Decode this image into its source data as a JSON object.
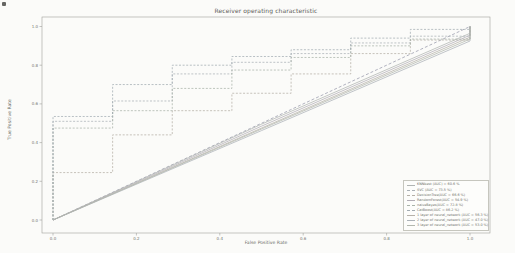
{
  "figure": {
    "title": "Receiver operating characteristic",
    "xlabel": "False Positive Rate",
    "ylabel": "True Positive Rate"
  },
  "chart_data": {
    "type": "line",
    "title": "Receiver operating characteristic",
    "xlabel": "False Positive Rate",
    "ylabel": "True Positive Rate",
    "xlim": [
      0.0,
      1.0
    ],
    "ylim": [
      0.0,
      1.0
    ],
    "x_ticks": [
      "0.0",
      "0.2",
      "0.4",
      "0.6",
      "0.8",
      "1.0"
    ],
    "y_ticks": [
      "0.0",
      "0.2",
      "0.4",
      "0.6",
      "0.8",
      "1.0"
    ],
    "grid": false,
    "legend_position": "lower right",
    "frame_color": "#a0a09a",
    "diagonal": {
      "name": "chance",
      "color": "#9899ab",
      "dash": "3,2",
      "points": [
        [
          0,
          0
        ],
        [
          1,
          1
        ]
      ]
    },
    "series": [
      {
        "name": "KNNbest",
        "label": "KNNbest (AUC) = 60.6 %",
        "auc_pct": 60.6,
        "color": "#b0b4b2",
        "dash": "none",
        "points": [
          [
            0,
            0
          ],
          [
            0.5,
            0.495
          ],
          [
            1,
            0.965
          ],
          [
            1,
            1
          ]
        ]
      },
      {
        "name": "SVC",
        "label": "SVC (AUC = 73.5 %)",
        "auc_pct": 73.5,
        "color": "#aab0b5",
        "dash": "2,1.6",
        "points": [
          [
            0,
            0
          ],
          [
            0,
            0.51
          ],
          [
            0.143,
            0.51
          ],
          [
            0.143,
            0.615
          ],
          [
            0.286,
            0.615
          ],
          [
            0.286,
            0.755
          ],
          [
            0.429,
            0.755
          ],
          [
            0.429,
            0.815
          ],
          [
            0.571,
            0.815
          ],
          [
            0.571,
            0.86
          ],
          [
            0.714,
            0.86
          ],
          [
            0.714,
            0.915
          ],
          [
            0.857,
            0.915
          ],
          [
            0.857,
            0.95
          ],
          [
            1,
            0.95
          ],
          [
            1,
            1
          ]
        ]
      },
      {
        "name": "DecisionTree",
        "label": "DecisionTree(AUC = 66.6 %)",
        "auc_pct": 66.6,
        "color": "#b4afa6",
        "dash": "2,1.6",
        "points": [
          [
            0,
            0
          ],
          [
            0,
            0.245
          ],
          [
            0.143,
            0.245
          ],
          [
            0.143,
            0.44
          ],
          [
            0.286,
            0.44
          ],
          [
            0.286,
            0.565
          ],
          [
            0.429,
            0.565
          ],
          [
            0.429,
            0.655
          ],
          [
            0.571,
            0.655
          ],
          [
            0.571,
            0.755
          ],
          [
            0.714,
            0.755
          ],
          [
            0.714,
            0.86
          ],
          [
            0.857,
            0.86
          ],
          [
            0.857,
            0.93
          ],
          [
            1,
            0.93
          ],
          [
            1,
            1
          ]
        ]
      },
      {
        "name": "RandomForest",
        "label": "RandomForest(AUC = 54.9 %)",
        "auc_pct": 54.9,
        "color": "#b2adb5",
        "dash": "none",
        "points": [
          [
            0,
            0
          ],
          [
            0.5,
            0.485
          ],
          [
            1,
            0.955
          ],
          [
            1,
            1
          ]
        ]
      },
      {
        "name": "naiveBayes",
        "label": "naiveBayes(AUC = 72.8 %)",
        "auc_pct": 72.8,
        "color": "#a8b2a8",
        "dash": "2,1.6",
        "points": [
          [
            0,
            0
          ],
          [
            0,
            0.475
          ],
          [
            0.143,
            0.475
          ],
          [
            0.143,
            0.565
          ],
          [
            0.286,
            0.565
          ],
          [
            0.286,
            0.68
          ],
          [
            0.429,
            0.68
          ],
          [
            0.429,
            0.775
          ],
          [
            0.571,
            0.775
          ],
          [
            0.571,
            0.84
          ],
          [
            0.714,
            0.84
          ],
          [
            0.714,
            0.9
          ],
          [
            0.857,
            0.9
          ],
          [
            0.857,
            0.935
          ],
          [
            1,
            0.935
          ],
          [
            1,
            1
          ]
        ]
      },
      {
        "name": "CatBoost",
        "label": "CatBoost(AUC = 86.2 %)",
        "auc_pct": 86.2,
        "color": "#a2abb1",
        "dash": "2,1.6",
        "points": [
          [
            0,
            0
          ],
          [
            0,
            0.535
          ],
          [
            0.143,
            0.535
          ],
          [
            0.143,
            0.7
          ],
          [
            0.286,
            0.7
          ],
          [
            0.286,
            0.8
          ],
          [
            0.429,
            0.8
          ],
          [
            0.429,
            0.845
          ],
          [
            0.571,
            0.845
          ],
          [
            0.571,
            0.88
          ],
          [
            0.714,
            0.88
          ],
          [
            0.714,
            0.94
          ],
          [
            0.857,
            0.94
          ],
          [
            0.857,
            0.985
          ],
          [
            1,
            0.985
          ],
          [
            1,
            1
          ]
        ]
      },
      {
        "name": "nn-1-layer",
        "label": "1 layer of neural_network (AUC = 56.3 %)",
        "auc_pct": 56.3,
        "color": "#b6b1a9",
        "dash": "none",
        "points": [
          [
            0,
            0
          ],
          [
            0.5,
            0.475
          ],
          [
            1,
            0.945
          ],
          [
            1,
            1
          ]
        ]
      },
      {
        "name": "nn-2-layer",
        "label": "2 layer of neural_network (AUC = 47.0 %)",
        "auc_pct": 47.0,
        "color": "#acb2b8",
        "dash": "none",
        "points": [
          [
            0,
            0
          ],
          [
            0.5,
            0.462
          ],
          [
            1,
            0.925
          ],
          [
            1,
            1
          ]
        ]
      },
      {
        "name": "nn-3-layer",
        "label": "3 layer of neural_network (AUC = 53.0 %)",
        "auc_pct": 53.0,
        "color": "#b2b7ae",
        "dash": "none",
        "points": [
          [
            0,
            0
          ],
          [
            0.5,
            0.47
          ],
          [
            1,
            0.935
          ],
          [
            1,
            1
          ]
        ]
      }
    ]
  }
}
